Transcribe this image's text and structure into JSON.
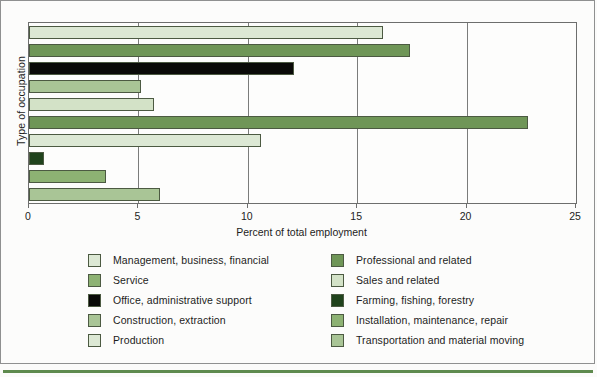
{
  "chart_data": {
    "type": "bar",
    "orientation": "horizontal",
    "title": "",
    "xlabel": "Percent of total employment",
    "ylabel": "Type of occupation",
    "xlim": [
      0,
      25
    ],
    "xticks": [
      0,
      5,
      10,
      15,
      20,
      25
    ],
    "xtick_labels": [
      "0",
      "5",
      "10",
      "15",
      "20",
      "25"
    ],
    "grid": true,
    "legend_position": "bottom",
    "categories": [
      "Management, business, financial",
      "Professional and related",
      "Office, administrative support",
      "Service",
      "Sales and related",
      "Construction, extraction",
      "Production",
      "Farming, fishing, forestry",
      "Installation, maintenance, repair",
      "Transportation and material moving"
    ],
    "values": [
      16.2,
      17.4,
      12.1,
      5.1,
      5.7,
      22.8,
      10.6,
      0.7,
      3.5,
      6.0
    ],
    "colors": [
      "#dce8d4",
      "#6f9657",
      "#0a0a08",
      "#a9c596",
      "#d3e2c7",
      "#6f9657",
      "#dce8d4",
      "#20431c",
      "#8db273",
      "#a9c596"
    ]
  },
  "axes": {
    "y_title": "Type of occupation",
    "x_title": "Percent of total employment",
    "x_ticks": [
      "0",
      "5",
      "10",
      "15",
      "20",
      "25"
    ]
  },
  "legend": {
    "left_column": [
      {
        "label": "Management, business, financial",
        "color": "#dce8d4"
      },
      {
        "label": "Service",
        "color": "#8db273"
      },
      {
        "label": "Office, administrative support",
        "color": "#0a0a08"
      },
      {
        "label": "Construction, extraction",
        "color": "#a9c596"
      },
      {
        "label": "Production",
        "color": "#dce8d4"
      }
    ],
    "right_column": [
      {
        "label": "Professional and related",
        "color": "#6f9657"
      },
      {
        "label": "Sales and related",
        "color": "#d3e2c7"
      },
      {
        "label": "Farming, fishing, forestry",
        "color": "#20431c"
      },
      {
        "label": "Installation, maintenance, repair",
        "color": "#8db273"
      },
      {
        "label": "Transportation and material moving",
        "color": "#a9c596"
      }
    ]
  },
  "style": {
    "accent": "#5e8a4e",
    "frame_color": "#8f9090",
    "text_color": "#1d1d1b"
  }
}
